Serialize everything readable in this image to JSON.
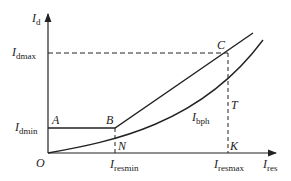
{
  "diagram": {
    "type": "differential-protection-characteristic",
    "axes": {
      "y_label": {
        "main": "I",
        "sub": "d"
      },
      "x_label": {
        "main": "I",
        "sub": "res"
      },
      "origin": "O"
    },
    "y_ticks": [
      {
        "main": "I",
        "sub": "dmax"
      },
      {
        "main": "I",
        "sub": "dmin"
      }
    ],
    "x_ticks": [
      {
        "main": "I",
        "sub": "resmin"
      },
      {
        "main": "I",
        "sub": "resmax"
      }
    ],
    "points": {
      "A": "A",
      "B": "B",
      "C": "C",
      "N": "N",
      "T": "T",
      "K": "K"
    },
    "curve_label": {
      "main": "I",
      "sub": "bph"
    },
    "colors": {
      "line": "#222222",
      "background": "#ffffff"
    }
  }
}
